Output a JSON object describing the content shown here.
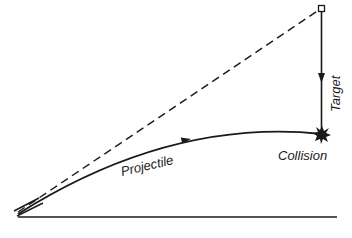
{
  "diagram": {
    "labels": {
      "projectile": "Projectile",
      "collision": "Collision",
      "target": "Target"
    },
    "elements": [
      {
        "id": "line-of-sight",
        "style": "dashed",
        "from": "launcher",
        "to": "target-start"
      },
      {
        "id": "projectile-path",
        "style": "solid-curve",
        "from": "launcher",
        "to": "collision-point"
      },
      {
        "id": "target-path",
        "style": "solid-vertical",
        "from": "target-start",
        "to": "collision-point"
      },
      {
        "id": "ground",
        "style": "solid-horizontal"
      }
    ],
    "colors": {
      "ink": "#1a1a1a",
      "background": "#ffffff"
    }
  }
}
